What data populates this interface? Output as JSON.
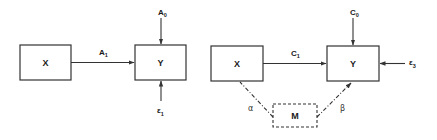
{
  "colors": {
    "stroke": "#333333",
    "text": "#1a1a1a",
    "background": "#ffffff"
  },
  "left_diagram": {
    "nodes": {
      "x": {
        "label": "X"
      },
      "y": {
        "label": "Y"
      }
    },
    "edges": {
      "x_to_y": {
        "label": "A",
        "sub": "1"
      },
      "intercept": {
        "label": "A",
        "sub": "0"
      },
      "error": {
        "label": "ε",
        "sub": "1"
      }
    }
  },
  "right_diagram": {
    "nodes": {
      "x": {
        "label": "X"
      },
      "y": {
        "label": "Y"
      },
      "m": {
        "label": "M",
        "style": "dashed"
      }
    },
    "edges": {
      "x_to_y": {
        "label": "C",
        "sub": "1"
      },
      "intercept": {
        "label": "C",
        "sub": "0"
      },
      "error": {
        "label": "ε",
        "sub": "3"
      },
      "x_to_m": {
        "label": "α",
        "style": "dash-dot"
      },
      "m_to_y": {
        "label": "β",
        "style": "dash-dot"
      }
    }
  }
}
